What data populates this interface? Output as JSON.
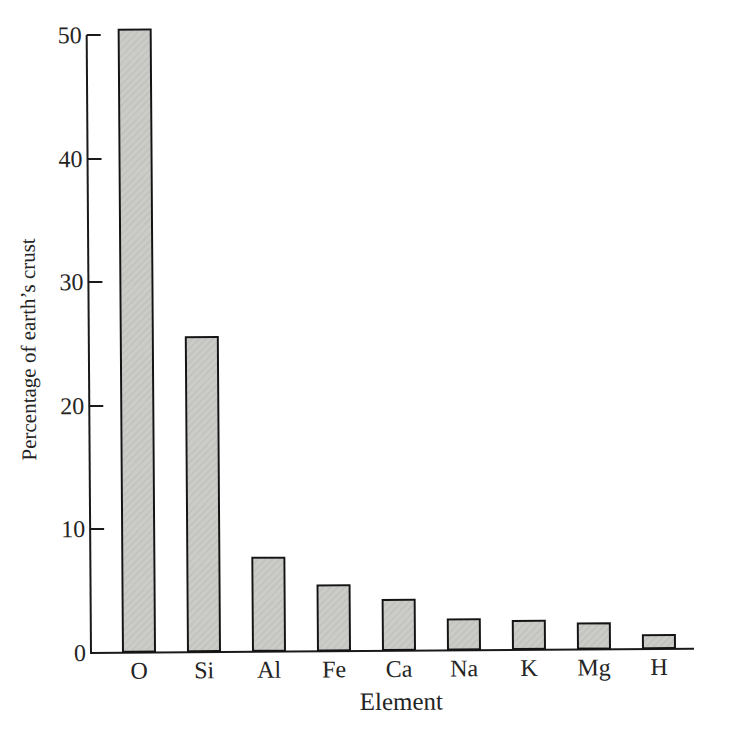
{
  "figure": {
    "background_color": "#ffffff",
    "text_color": "#242424",
    "axis_color": "#1a1a1a",
    "bar_fill_color": "#c9cac6",
    "bar_border_color": "#141414"
  },
  "chart_data": {
    "type": "bar",
    "title": "",
    "categories": [
      "O",
      "Si",
      "Al",
      "Fe",
      "Ca",
      "Na",
      "K",
      "Mg",
      "H"
    ],
    "values": [
      50.5,
      25.6,
      7.7,
      5.4,
      4.2,
      2.6,
      2.4,
      2.2,
      1.2
    ],
    "xlabel": "Element",
    "ylabel": "Percentage of earth’s crust",
    "yticks": [
      0,
      10,
      20,
      30,
      40,
      50
    ],
    "ylim": [
      0,
      50
    ],
    "grid": false,
    "legend": null,
    "bar_style": "gray hatched fill with black outline"
  }
}
